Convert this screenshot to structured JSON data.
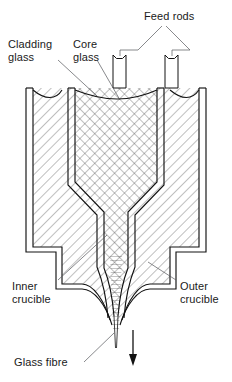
{
  "figure": {
    "labels": [
      {
        "id": "feed-rods",
        "text": "Feed rods",
        "lines": [
          "Feed rods"
        ],
        "x": 144,
        "y": 16
      },
      {
        "id": "cladding-glass",
        "text": "Cladding glass",
        "lines": [
          "Cladding",
          "glass"
        ],
        "x": 8,
        "y": 44
      },
      {
        "id": "core-glass",
        "text": "Core glass",
        "lines": [
          "Core",
          "glass"
        ],
        "x": 73,
        "y": 44
      },
      {
        "id": "inner-crucible",
        "text": "Inner crucible",
        "lines": [
          "Inner",
          "crucible"
        ],
        "x": 12,
        "y": 286
      },
      {
        "id": "outer-crucible",
        "text": "Outer crucible",
        "lines": [
          "Outer",
          "crucible"
        ],
        "x": 180,
        "y": 286
      },
      {
        "id": "glass-fibre",
        "text": "Glass fibre",
        "lines": [
          "Glass fibre"
        ],
        "x": 14,
        "y": 366
      }
    ],
    "colors": {
      "outline": "#121212",
      "leader": "#55565a",
      "text": "#1a1a1a",
      "hatch": "#3a3a3a",
      "background": "#ffffff"
    },
    "parts": {
      "outer_crucible": "Outer crucible",
      "inner_crucible": "Inner crucible",
      "feed_rod_left": "Feed rod",
      "feed_rod_right": "Feed rod",
      "fibre_arrow": "Drawing direction",
      "fibre": "Glass fibre"
    }
  }
}
